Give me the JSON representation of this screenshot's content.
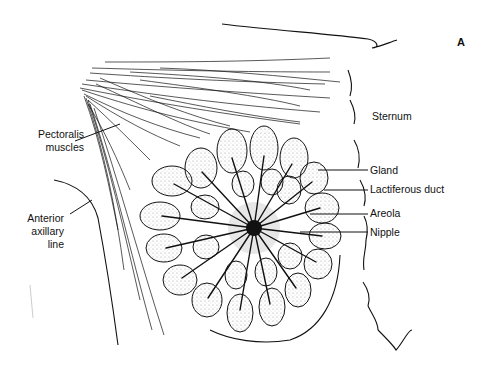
{
  "figure": {
    "panel_letter": "A"
  },
  "labels": {
    "pectoralis": [
      "Pectoralis",
      "muscles"
    ],
    "axillary": [
      "Anterior",
      "axillary",
      "line"
    ],
    "sternum": "Sternum",
    "gland": "Gland",
    "duct": "Lactiferous duct",
    "areola": "Areola",
    "nipple": "Nipple"
  },
  "colors": {
    "ink": "#111111",
    "background": "#ffffff",
    "stipple": "#9a9a9a"
  }
}
